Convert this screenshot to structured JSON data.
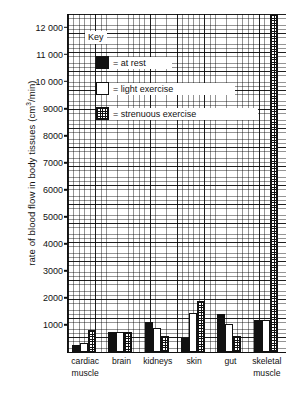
{
  "chart_data": {
    "type": "bar",
    "title": "",
    "xlabel": "",
    "ylabel": "rate of blood flow in body tissues (cm3/min)",
    "ylabel_prefix": "rate of blood flow in body tissues (cm",
    "ylabel_sup": "3",
    "ylabel_suffix": "/min)",
    "ylim": [
      0,
      12500
    ],
    "grid": true,
    "grid_style": "graph-paper",
    "legend_position": "upper-left-inside",
    "categories": [
      "cardiac muscle",
      "brain",
      "kidneys",
      "skin",
      "gut",
      "skeletal muscle"
    ],
    "ticks": [
      "1000",
      "2000",
      "3000",
      "4000",
      "5000",
      "6000",
      "7000",
      "8000",
      "9000",
      "10 000",
      "11 000",
      "12 000"
    ],
    "tick_values": [
      1000,
      2000,
      3000,
      4000,
      5000,
      6000,
      7000,
      8000,
      9000,
      10000,
      11000,
      12000
    ],
    "series": [
      {
        "name": "at rest",
        "key": "rest",
        "fill": "solid-black",
        "values": [
          250,
          750,
          1100,
          500,
          1400,
          1200
        ]
      },
      {
        "name": "light exercise",
        "key": "light",
        "fill": "white",
        "values": [
          350,
          750,
          900,
          1450,
          1050,
          1200
        ]
      },
      {
        "name": "strenuous exercise",
        "key": "stren",
        "fill": "cross-hatch",
        "values": [
          800,
          750,
          600,
          1900,
          600,
          12500
        ]
      }
    ]
  },
  "legend": {
    "title": "Key",
    "items": [
      {
        "label": "= at rest",
        "key": "rest"
      },
      {
        "label": "= light exercise",
        "key": "light"
      },
      {
        "label": "= strenuous exercise",
        "key": "stren"
      }
    ]
  },
  "axis": {
    "y_labels": [
      "12 000",
      "11 000",
      "10 000",
      "9000",
      "8000",
      "7000",
      "6000",
      "5000",
      "4000",
      "3000",
      "2000",
      "1000"
    ],
    "x_labels": [
      "cardiac\nmuscle",
      "brain",
      "kidneys",
      "skin",
      "gut",
      "skeletal\nmuscle"
    ]
  },
  "colors": {
    "ink": "#111111",
    "paper": "#ffffff"
  }
}
